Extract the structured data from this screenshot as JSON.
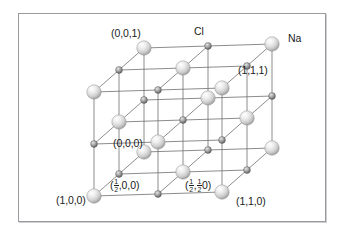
{
  "figure": {
    "background_color": "#ffffff",
    "frame_color": "#9a9a9e"
  },
  "species": [
    {
      "key": "cl",
      "label": "Cl",
      "role": "large-anion",
      "radius_px": 7.2,
      "color_light": "#f2f2f2",
      "color_mid": "#d4d4d4",
      "color_dark": "#9e9e9e"
    },
    {
      "key": "na",
      "label": "Na",
      "role": "small-cation",
      "radius_px": 3.4,
      "color_light": "#d8d8d8",
      "color_mid": "#9d9d9d",
      "color_dark": "#6f6f6f"
    }
  ],
  "legend_labels": [
    {
      "id": "cl-label",
      "text": "Cl",
      "x": 194,
      "y": 26
    },
    {
      "id": "na-label",
      "text": "Na",
      "x": 288,
      "y": 33
    }
  ],
  "coordinate_labels": [
    {
      "id": "c001",
      "text": "(0,0,1)",
      "x": 111,
      "y": 28,
      "kind": "plain"
    },
    {
      "id": "c111",
      "text": "(1,1,1)",
      "x": 238,
      "y": 65,
      "kind": "plain"
    },
    {
      "id": "c000",
      "text": "(0,0,0)",
      "x": 113,
      "y": 138,
      "kind": "plain"
    },
    {
      "id": "c100",
      "text": "(1,0,0)",
      "x": 56,
      "y": 195,
      "kind": "plain"
    },
    {
      "id": "c110",
      "text": "(1,1,0)",
      "x": 236,
      "y": 196,
      "kind": "plain"
    },
    {
      "id": "chalf00",
      "kind": "fraction",
      "x": 110,
      "y": 178,
      "parts": [
        "(",
        "FRAC",
        ",0,0)"
      ],
      "text": "(1/2,0,0)"
    },
    {
      "id": "chalfhalf0",
      "kind": "fraction2",
      "x": 185,
      "y": 178,
      "parts": [
        "(",
        "FRAC",
        ",",
        "FRAC",
        "0)"
      ],
      "text": "(1/2,1/2 0)"
    }
  ],
  "fraction": {
    "numerator": "1",
    "denominator": "2"
  },
  "lattice": {
    "description": "3 x 3 x 3 alternating ion grid drawn in oblique projection",
    "grid_n": 3,
    "origin_x": 94,
    "origin_y": 196,
    "axis_x": {
      "dx": 64.0,
      "dy": -2.0
    },
    "axis_y": {
      "dx": 25.0,
      "dy": -22.0
    },
    "axis_z": {
      "dx": 0.0,
      "dy": -52.0
    },
    "bond_color": "#6e6e72",
    "bond_width": 0.8
  }
}
